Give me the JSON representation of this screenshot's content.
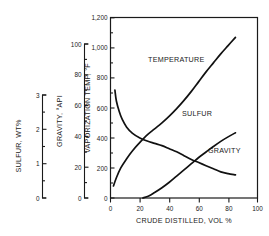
{
  "chart_data": {
    "type": "line",
    "title": "",
    "xlabel": "CRUDE DISTILLED, VOL %",
    "xlim": [
      0,
      100
    ],
    "xticks": [
      0,
      20,
      40,
      60,
      80,
      100
    ],
    "xtick_labels": [
      "0",
      "20",
      "40",
      "60",
      "80",
      "100"
    ],
    "grid": false,
    "legend_position": "inline-labels",
    "axes": [
      {
        "id": "sulfur",
        "label": "SULFUR, WT%",
        "lim": [
          0,
          3
        ],
        "ticks": [
          0,
          1,
          2,
          3
        ],
        "tick_labels": [
          "0",
          "1",
          "2",
          "3"
        ],
        "minor_tick_step": 0.25
      },
      {
        "id": "gravity",
        "label": "GRAVITY, °API",
        "lim": [
          0,
          100
        ],
        "ticks": [
          0,
          20,
          40,
          60,
          80,
          100
        ],
        "tick_labels": [
          "0",
          "20",
          "40",
          "60",
          "80",
          "100"
        ],
        "minor_tick_step": 10
      },
      {
        "id": "temperature",
        "label": "VAPORIZATION TEMP, °F",
        "lim": [
          0,
          1200
        ],
        "ticks": [
          0,
          200,
          400,
          600,
          800,
          1000,
          1200
        ],
        "tick_labels": [
          "0",
          "200",
          "400",
          "600",
          "800",
          "1,000",
          "1,200"
        ],
        "minor_tick_step": 100
      }
    ],
    "series": [
      {
        "name": "TEMPERATURE",
        "axis": "temperature",
        "units": "°F",
        "label_text": "TEMPERATURE",
        "points": [
          [
            2,
            80
          ],
          [
            4,
            135
          ],
          [
            7,
            200
          ],
          [
            11,
            262
          ],
          [
            15,
            315
          ],
          [
            20,
            370
          ],
          [
            25,
            420
          ],
          [
            30,
            460
          ],
          [
            35,
            500
          ],
          [
            40,
            545
          ],
          [
            45,
            595
          ],
          [
            50,
            650
          ],
          [
            55,
            710
          ],
          [
            60,
            775
          ],
          [
            65,
            840
          ],
          [
            70,
            900
          ],
          [
            75,
            960
          ],
          [
            80,
            1015
          ],
          [
            85,
            1070
          ]
        ]
      },
      {
        "name": "SULFUR",
        "axis": "sulfur",
        "units": "WT%",
        "label_text": "SULFUR",
        "points": [
          [
            22,
            0.0
          ],
          [
            26,
            0.06
          ],
          [
            30,
            0.16
          ],
          [
            35,
            0.3
          ],
          [
            40,
            0.46
          ],
          [
            45,
            0.64
          ],
          [
            50,
            0.82
          ],
          [
            55,
            1.0
          ],
          [
            60,
            1.18
          ],
          [
            65,
            1.34
          ],
          [
            70,
            1.5
          ],
          [
            75,
            1.65
          ],
          [
            80,
            1.78
          ],
          [
            85,
            1.9
          ]
        ]
      },
      {
        "name": "GRAVITY",
        "axis": "gravity",
        "units": "°API",
        "label_text": "GRAVITY",
        "points": [
          [
            3,
            70
          ],
          [
            4,
            63
          ],
          [
            6,
            56
          ],
          [
            8,
            51
          ],
          [
            11,
            46
          ],
          [
            15,
            42
          ],
          [
            20,
            39
          ],
          [
            25,
            37
          ],
          [
            30,
            35.5
          ],
          [
            35,
            34
          ],
          [
            40,
            32
          ],
          [
            45,
            30
          ],
          [
            50,
            27.5
          ],
          [
            55,
            25
          ],
          [
            60,
            23
          ],
          [
            65,
            21
          ],
          [
            70,
            19
          ],
          [
            75,
            17
          ],
          [
            80,
            15.8
          ],
          [
            85,
            15
          ]
        ]
      }
    ]
  }
}
